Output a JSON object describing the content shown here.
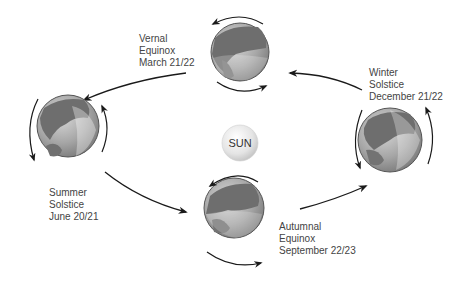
{
  "diagram": {
    "sun": {
      "label": "SUN"
    },
    "positions": [
      {
        "id": "vernal",
        "line1": "Vernal",
        "line2": "Equinox",
        "line3": "March 21/22"
      },
      {
        "id": "summer",
        "line1": "Summer",
        "line2": "Solstice",
        "line3": "June 20/21"
      },
      {
        "id": "autumnal",
        "line1": "Autumnal",
        "line2": "Equinox",
        "line3": "September 22/23"
      },
      {
        "id": "winter",
        "line1": "Winter",
        "line2": "Solstice",
        "line3": "December 21/22"
      }
    ],
    "colors": {
      "arrow": "#1a1a1a",
      "text": "#444444",
      "globe_land": "#6e6e6e",
      "globe_ocean": "#a8a8a8",
      "sun_fill": "#e6e6e6"
    }
  }
}
